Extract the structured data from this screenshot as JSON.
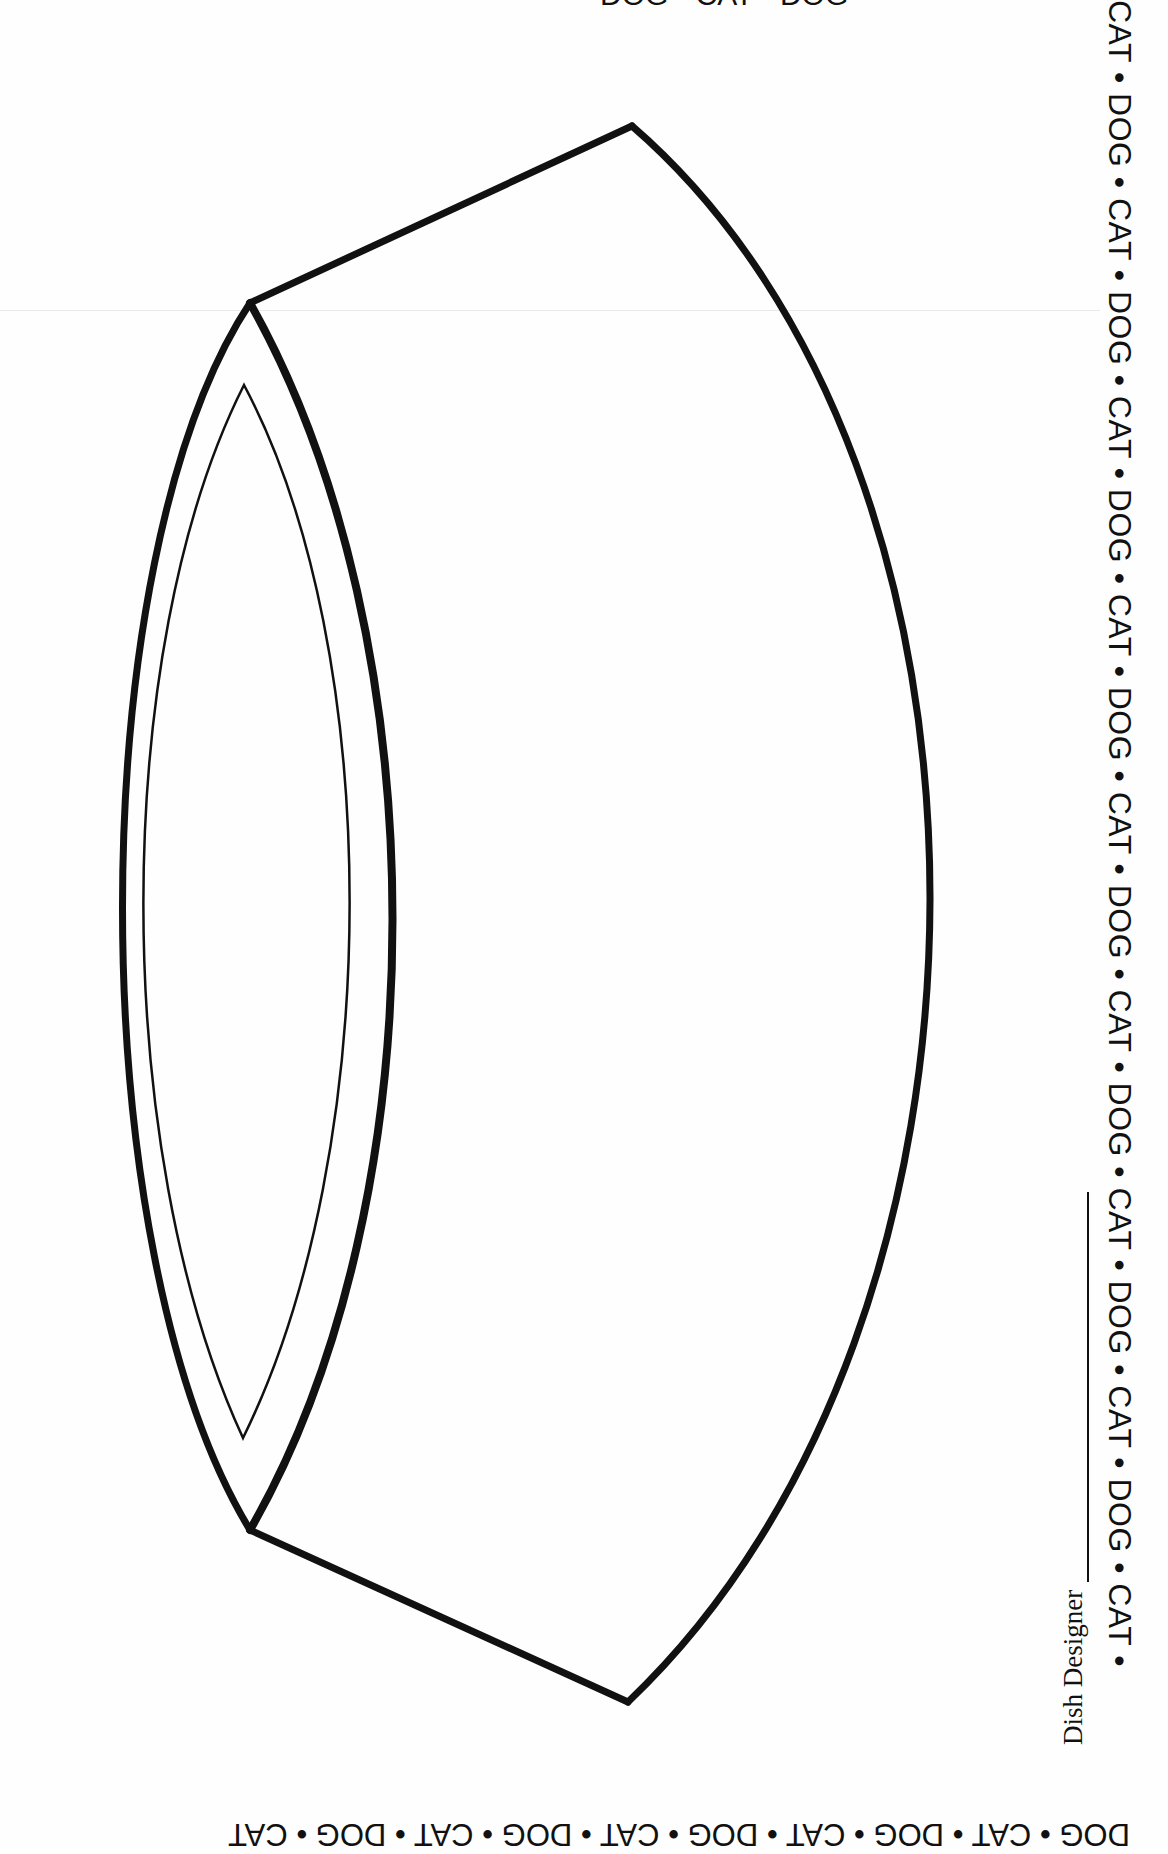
{
  "worksheet": {
    "border_pattern_right": "CAT • DOG • CAT • DOG • CAT • DOG • CAT • DOG • CAT • DOG • CAT • DOG • CAT • DOG • CAT • DOG • CAT •",
    "border_pattern_bottom": "DOG • CAT • DOG • CAT • DOG • CAT • DOG • CAT • DOG • CAT",
    "border_pattern_top": "DOG • CAT • DOG",
    "designer_label": "Dish Designer",
    "illustration": "pet-food-bowl-outline",
    "colors": {
      "ink": "#111111",
      "paper": "#fefefe"
    }
  }
}
